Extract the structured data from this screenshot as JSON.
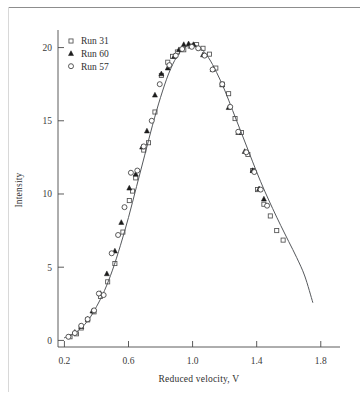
{
  "figure": {
    "background_color": "#ffffff",
    "frame_rule_color": "#8d8d8d"
  },
  "chart_data": {
    "type": "scatter",
    "title": "",
    "subtitle": "",
    "xlabel": "Reduced velocity, V",
    "ylabel": "Intensity",
    "xlim": [
      0.16,
      1.92
    ],
    "ylim": [
      -0.45,
      21.2
    ],
    "grid": false,
    "legend_position": "top-left-inside",
    "xticks": [
      0.2,
      0.6,
      1.0,
      1.4,
      1.8
    ],
    "xtick_labels": [
      "0.2",
      "0.6",
      "1.0",
      "1.4",
      "1.8"
    ],
    "yticks": [
      0,
      5,
      10,
      15,
      20
    ],
    "ytick_labels": [
      "0",
      "5",
      "10",
      "15",
      "20"
    ],
    "series": [
      {
        "name": "Run 31",
        "marker": "open-square",
        "color": "#4f4f4f",
        "points": [
          [
            0.235,
            0.25
          ],
          [
            0.275,
            0.45
          ],
          [
            0.305,
            0.85
          ],
          [
            0.345,
            1.4
          ],
          [
            0.385,
            1.95
          ],
          [
            0.425,
            3.0
          ],
          [
            0.47,
            4.0
          ],
          [
            0.515,
            5.25
          ],
          [
            0.565,
            7.4
          ],
          [
            0.605,
            9.55
          ],
          [
            0.625,
            10.2
          ],
          [
            0.645,
            11.1
          ],
          [
            0.695,
            13.0
          ],
          [
            0.725,
            13.5
          ],
          [
            0.765,
            15.6
          ],
          [
            0.805,
            18.1
          ],
          [
            0.845,
            19.0
          ],
          [
            0.875,
            19.4
          ],
          [
            0.905,
            19.7
          ],
          [
            0.945,
            19.85
          ],
          [
            0.985,
            20.1
          ],
          [
            1.025,
            20.2
          ],
          [
            1.065,
            19.95
          ],
          [
            1.105,
            19.55
          ],
          [
            1.145,
            18.6
          ],
          [
            1.185,
            17.5
          ],
          [
            1.225,
            16.85
          ],
          [
            1.265,
            15.15
          ],
          [
            1.305,
            14.2
          ],
          [
            1.345,
            12.7
          ],
          [
            1.375,
            11.6
          ],
          [
            1.405,
            10.3
          ],
          [
            1.445,
            9.3
          ],
          [
            1.485,
            8.5
          ],
          [
            1.525,
            7.5
          ],
          [
            1.565,
            6.85
          ]
        ]
      },
      {
        "name": "Run 60",
        "marker": "filled-triangle",
        "color": "#1c1c1c",
        "points": [
          [
            0.265,
            0.55
          ],
          [
            0.305,
            0.95
          ],
          [
            0.345,
            1.45
          ],
          [
            0.375,
            2.0
          ],
          [
            0.425,
            3.2
          ],
          [
            0.465,
            4.55
          ],
          [
            0.515,
            6.1
          ],
          [
            0.555,
            8.05
          ],
          [
            0.605,
            10.4
          ],
          [
            0.645,
            11.35
          ],
          [
            0.685,
            13.2
          ],
          [
            0.715,
            14.3
          ],
          [
            0.765,
            16.75
          ],
          [
            0.805,
            18.2
          ],
          [
            0.845,
            18.6
          ],
          [
            0.885,
            19.4
          ],
          [
            0.915,
            19.85
          ],
          [
            0.945,
            20.2
          ],
          [
            0.975,
            20.25
          ],
          [
            1.005,
            20.2
          ],
          [
            1.065,
            19.5
          ],
          [
            1.125,
            18.5
          ],
          [
            1.185,
            17.45
          ],
          [
            1.225,
            15.9
          ],
          [
            1.285,
            14.2
          ],
          [
            1.325,
            12.9
          ],
          [
            1.375,
            11.6
          ],
          [
            1.415,
            10.35
          ],
          [
            1.445,
            9.65
          ]
        ]
      },
      {
        "name": "Run 57",
        "marker": "open-circle",
        "color": "#3d3d3d",
        "points": [
          [
            0.225,
            0.25
          ],
          [
            0.265,
            0.5
          ],
          [
            0.305,
            1.0
          ],
          [
            0.345,
            1.45
          ],
          [
            0.385,
            2.05
          ],
          [
            0.415,
            3.2
          ],
          [
            0.445,
            3.1
          ],
          [
            0.495,
            5.95
          ],
          [
            0.535,
            7.2
          ],
          [
            0.575,
            9.1
          ],
          [
            0.615,
            11.45
          ],
          [
            0.655,
            11.6
          ],
          [
            0.695,
            13.25
          ],
          [
            0.745,
            15.0
          ],
          [
            0.795,
            17.5
          ],
          [
            0.855,
            18.8
          ],
          [
            0.895,
            19.45
          ],
          [
            0.935,
            19.9
          ],
          [
            0.995,
            20.05
          ],
          [
            1.035,
            19.95
          ],
          [
            1.075,
            19.45
          ],
          [
            1.125,
            18.5
          ],
          [
            1.185,
            17.5
          ],
          [
            1.235,
            15.95
          ],
          [
            1.285,
            14.25
          ],
          [
            1.335,
            12.85
          ],
          [
            1.385,
            11.5
          ],
          [
            1.425,
            10.3
          ],
          [
            1.465,
            9.2
          ]
        ]
      },
      {
        "name": "fit curve",
        "marker": "line",
        "color": "#55585c",
        "points": [
          [
            0.2,
            0.18
          ],
          [
            0.25,
            0.4
          ],
          [
            0.3,
            0.8
          ],
          [
            0.35,
            1.4
          ],
          [
            0.4,
            2.3
          ],
          [
            0.45,
            3.4
          ],
          [
            0.5,
            4.8
          ],
          [
            0.55,
            6.5
          ],
          [
            0.6,
            8.4
          ],
          [
            0.65,
            10.5
          ],
          [
            0.7,
            12.6
          ],
          [
            0.75,
            14.7
          ],
          [
            0.8,
            16.6
          ],
          [
            0.85,
            18.2
          ],
          [
            0.9,
            19.35
          ],
          [
            0.95,
            20.0
          ],
          [
            1.0,
            20.2
          ],
          [
            1.05,
            19.95
          ],
          [
            1.1,
            19.3
          ],
          [
            1.15,
            18.3
          ],
          [
            1.2,
            17.1
          ],
          [
            1.25,
            15.7
          ],
          [
            1.3,
            14.3
          ],
          [
            1.35,
            12.9
          ],
          [
            1.4,
            11.5
          ],
          [
            1.45,
            10.2
          ],
          [
            1.5,
            9.0
          ],
          [
            1.55,
            7.85
          ],
          [
            1.6,
            6.75
          ],
          [
            1.65,
            5.65
          ],
          [
            1.7,
            4.4
          ],
          [
            1.75,
            2.6
          ]
        ]
      }
    ],
    "legend_entries": [
      {
        "label": "Run 31",
        "marker": "open-square"
      },
      {
        "label": "Run 60",
        "marker": "filled-triangle"
      },
      {
        "label": "Run 57",
        "marker": "open-circle"
      }
    ]
  }
}
